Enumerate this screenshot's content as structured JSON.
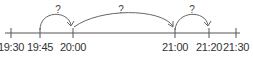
{
  "number_line": {
    "ticks": [
      {
        "label": "19:30",
        "x": 11
      },
      {
        "label": "19:45",
        "x": 40
      },
      {
        "label": "20:00",
        "x": 73
      },
      {
        "label": "21:00",
        "x": 175
      },
      {
        "label": "21:20",
        "x": 209
      },
      {
        "label": "21:30",
        "x": 236
      }
    ],
    "jumps": [
      {
        "from": "19:45",
        "to": "20:00",
        "label": "?"
      },
      {
        "from": "20:00",
        "to": "21:00",
        "label": "?"
      },
      {
        "from": "21:00",
        "to": "21:20",
        "label": "?"
      }
    ],
    "colors": {
      "line": "#555555",
      "arc": "#666666",
      "text": "#333333"
    }
  }
}
